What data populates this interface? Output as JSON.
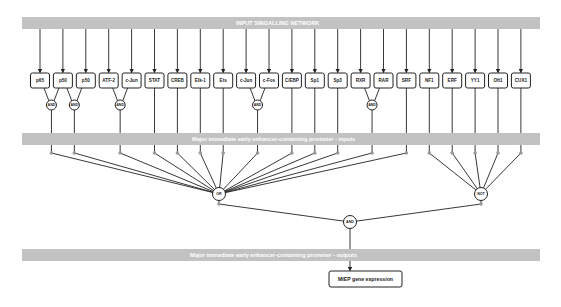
{
  "bars": {
    "input_network": "INPUT SINGALLING NETWORK",
    "promoter_inputs": "Major immediate early enhancer-containing promoter - inputs",
    "promoter_outputs": "Major immediate early enhancer-containing promoter - outputs"
  },
  "nodes": [
    {
      "id": "p65",
      "label": "p65"
    },
    {
      "id": "p50a",
      "label": "p50"
    },
    {
      "id": "p50b",
      "label": "p50"
    },
    {
      "id": "atf2",
      "label": "ATF-2"
    },
    {
      "id": "cjun1",
      "label": "c-Jun"
    },
    {
      "id": "stat",
      "label": "STAT"
    },
    {
      "id": "creb",
      "label": "CREB"
    },
    {
      "id": "elk1",
      "label": "Elk-1"
    },
    {
      "id": "ets",
      "label": "Ets"
    },
    {
      "id": "cjun2",
      "label": "c-Jun"
    },
    {
      "id": "cfos",
      "label": "c-Fos"
    },
    {
      "id": "cebp",
      "label": "C/EBP"
    },
    {
      "id": "sp1",
      "label": "Sp1"
    },
    {
      "id": "sp3",
      "label": "Sp3"
    },
    {
      "id": "rxr",
      "label": "RXR"
    },
    {
      "id": "rar",
      "label": "RAR"
    },
    {
      "id": "srf",
      "label": "SRF"
    },
    {
      "id": "nf1",
      "label": "NF1"
    },
    {
      "id": "erf",
      "label": "ERF"
    },
    {
      "id": "yy1",
      "label": "YY1"
    },
    {
      "id": "oft1",
      "label": "Oft1"
    },
    {
      "id": "cux1",
      "label": "CUX1"
    }
  ],
  "and_gates": [
    {
      "label": "AND",
      "inputs": [
        "p65",
        "p50a"
      ]
    },
    {
      "label": "AND",
      "inputs": [
        "p50a",
        "p50b"
      ]
    },
    {
      "label": "AND",
      "inputs": [
        "atf2",
        "cjun1"
      ]
    },
    {
      "label": "AND",
      "inputs": [
        "cjun2",
        "cfos"
      ]
    },
    {
      "label": "AND",
      "inputs": [
        "rxr",
        "rar"
      ]
    }
  ],
  "direct_to_or": [
    "stat",
    "creb",
    "elk1",
    "ets",
    "cebp",
    "sp1",
    "sp3",
    "srf"
  ],
  "direct_to_not": [
    "nf1",
    "erf",
    "yy1",
    "oft1",
    "cux1"
  ],
  "or_gate": {
    "label": "OR"
  },
  "not_gate": {
    "label": "NOT"
  },
  "final_gate": {
    "label": "AND"
  },
  "output": {
    "label": "MIEP gene expression"
  }
}
